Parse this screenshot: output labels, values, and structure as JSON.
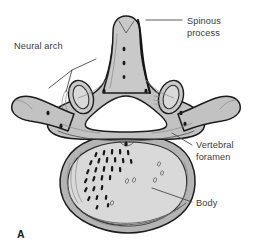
{
  "figure": {
    "panel_letter": "A",
    "background_color": "#ffffff"
  },
  "labels": [
    {
      "id": "spinous-process",
      "text_line_1": "Spinous",
      "text_line_2": "process",
      "text_x": 187,
      "text_y": 24,
      "leader": "M 182 20 L 146 20"
    },
    {
      "id": "neural-arch",
      "text_line_1": "Neural arch",
      "text_line_2": "",
      "text_x": 14,
      "text_y": 49,
      "leader": "M 96 59 L 72 70 L 49 88 M 72 70 L 66 92"
    },
    {
      "id": "vertebral-foramen",
      "text_line_1": "Vertebral",
      "text_line_2": "foramen",
      "text_x": 196,
      "text_y": 148,
      "leader": "M 192 145 L 172 133"
    },
    {
      "id": "body",
      "text_line_1": "Body",
      "text_line_2": "",
      "text_x": 196,
      "text_y": 206,
      "leader": "M 192 202 L 152 188"
    }
  ],
  "colors": {
    "bone_fill_light": "#d9d9d9",
    "bone_fill_mid": "#c2c2c2",
    "bone_fill_rim": "#b4b4b4",
    "foramen_fill": "#ffffff",
    "outline": "#1c1c1c",
    "text": "#3a3a3a",
    "leader": "#4a4a4a",
    "trabecula": "#161616"
  },
  "anatomy_parts": [
    {
      "name": "spinous-process",
      "description": "posterior midline projection with notched tip"
    },
    {
      "name": "neural-arch",
      "description": "bony ring enclosing vertebral foramen"
    },
    {
      "name": "vertebral-foramen",
      "description": "central triangular white opening"
    },
    {
      "name": "vertebral-body",
      "description": "large anterior kidney-shaped mass with trabecular bone"
    },
    {
      "name": "transverse-process-left",
      "description": "lateral projection to the left"
    },
    {
      "name": "transverse-process-right",
      "description": "lateral projection to the right"
    },
    {
      "name": "superior-articular-process-left",
      "description": "oval ring facet left of spinous process"
    },
    {
      "name": "superior-articular-process-right",
      "description": "oval ring facet right of spinous process"
    },
    {
      "name": "pedicle-left",
      "description": "connects body to arch, left"
    },
    {
      "name": "pedicle-right",
      "description": "connects body to arch, right"
    },
    {
      "name": "trabecular-bone",
      "description": "cluster of dark dashes in left body"
    }
  ]
}
